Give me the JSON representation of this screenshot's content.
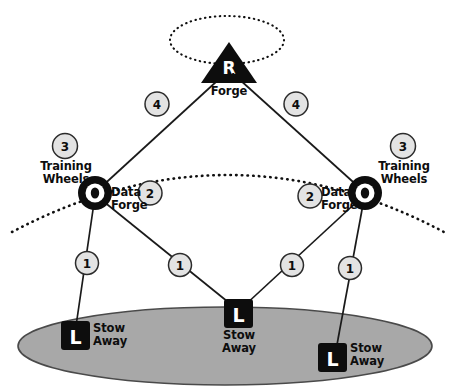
{
  "diagram": {
    "colors": {
      "node_fill": "#0d0d0d",
      "node_text": "#ffffff",
      "badge_fill": "#e3e3e3",
      "badge_stroke": "#2b2b2b",
      "edge_stroke": "#1a1a1a",
      "ground_fill": "#a8a8a8",
      "ground_stroke": "#4a4a4a",
      "background": "#ffffff"
    },
    "nodes": [
      {
        "id": "root",
        "glyph": "R",
        "shape": "triangle",
        "caption": "Data\nForge",
        "x": 229,
        "y": 63
      },
      {
        "id": "left-orbit",
        "glyph": "O",
        "shape": "ring",
        "caption": "Data\nForge",
        "x": 95,
        "y": 193
      },
      {
        "id": "right-orbit",
        "glyph": "O",
        "shape": "ring",
        "caption": "Data\nForge",
        "x": 365,
        "y": 193
      },
      {
        "id": "leaf-left",
        "glyph": "L",
        "shape": "square",
        "caption": "Stow\nAway",
        "x": 75,
        "y": 335
      },
      {
        "id": "leaf-middle",
        "glyph": "L",
        "shape": "square",
        "caption": "Stow\nAway",
        "x": 238,
        "y": 313
      },
      {
        "id": "leaf-right",
        "glyph": "L",
        "shape": "square",
        "caption": "Stow\nAway",
        "x": 332,
        "y": 357
      }
    ],
    "edge_badges": [
      {
        "id": "badge-root-left",
        "label": "4",
        "x": 157,
        "y": 104
      },
      {
        "id": "badge-root-right",
        "label": "4",
        "x": 296,
        "y": 104
      },
      {
        "id": "badge-left-orbit",
        "label": "2",
        "x": 150,
        "y": 193
      },
      {
        "id": "badge-right-orbit",
        "label": "2",
        "x": 310,
        "y": 196
      },
      {
        "id": "badge-left-leaf-left",
        "label": "1",
        "x": 87,
        "y": 263
      },
      {
        "id": "badge-left-leaf-mid",
        "label": "1",
        "x": 180,
        "y": 265
      },
      {
        "id": "badge-right-leaf-mid",
        "label": "1",
        "x": 292,
        "y": 265
      },
      {
        "id": "badge-right-leaf-right",
        "label": "1",
        "x": 350,
        "y": 268
      }
    ],
    "standalone_badges": [
      {
        "id": "badge-training-left",
        "label": "3",
        "x": 65,
        "y": 146
      },
      {
        "id": "badge-training-right",
        "label": "3",
        "x": 403,
        "y": 146
      }
    ],
    "annotations": [
      {
        "id": "training-wheels-left",
        "text": "Training\nWheels",
        "x": 33,
        "y": 166,
        "align": "center",
        "width": 66
      },
      {
        "id": "training-wheels-right",
        "text": "Training\nWheels",
        "x": 371,
        "y": 166,
        "align": "center",
        "width": 66
      },
      {
        "id": "data-forge-root",
        "text": "Data\nForge",
        "x": 207,
        "y": 74,
        "align": "center",
        "width": 46
      },
      {
        "id": "data-forge-left",
        "text": "Data\nForge",
        "x": 110,
        "y": 187,
        "align": "left",
        "width": 40
      },
      {
        "id": "data-forge-right",
        "text": "Data\nForge",
        "x": 320,
        "y": 187,
        "align": "left",
        "width": 40
      },
      {
        "id": "stow-away-left",
        "text": "Stow\nAway",
        "x": 92,
        "y": 323,
        "align": "left",
        "width": 46
      },
      {
        "id": "stow-away-middle",
        "text": "Stow\nAway",
        "x": 215,
        "y": 330,
        "align": "center",
        "width": 46
      },
      {
        "id": "stow-away-right",
        "text": "Stow\nAway",
        "x": 349,
        "y": 343,
        "align": "left",
        "width": 46
      }
    ],
    "layers": {
      "ground_label": "ground-plane",
      "orbit_curve_label": "training-wheels-orbit",
      "root_ellipse_label": "root-orbit"
    }
  }
}
